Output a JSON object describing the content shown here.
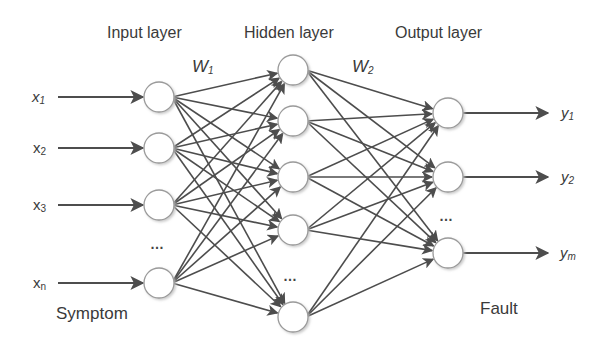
{
  "diagram": {
    "type": "neural-network",
    "colors": {
      "edge": "#4d4d4d",
      "node_stroke": "#9a9a9a",
      "node_fill": "#ffffff",
      "node_shadow": "#d9d9d9",
      "text": "#3a3a3a"
    },
    "layers": {
      "input": {
        "title": "Input layer",
        "caption": "Symptom",
        "ellipsis": "…",
        "nodes": [
          {
            "label_base": "x",
            "label_sub": "1",
            "italic": true
          },
          {
            "label_base": "x",
            "label_sub": "2",
            "italic": false
          },
          {
            "label_base": "x",
            "label_sub": "3",
            "italic": false
          },
          {
            "label_base": "x",
            "label_sub": "n",
            "italic": false
          }
        ]
      },
      "hidden": {
        "title": "Hidden layer",
        "ellipsis": "…",
        "node_count_visible": 5
      },
      "output": {
        "title": "Output layer",
        "caption": "Fault",
        "ellipsis": "…",
        "nodes": [
          {
            "label_base": "y",
            "label_sub": "1"
          },
          {
            "label_base": "y",
            "label_sub": "2"
          },
          {
            "label_base": "y",
            "label_sub": "m"
          }
        ]
      }
    },
    "weights": [
      {
        "base": "W",
        "sub": "1"
      },
      {
        "base": "W",
        "sub": "2"
      }
    ],
    "connectivity": "fully-connected"
  }
}
